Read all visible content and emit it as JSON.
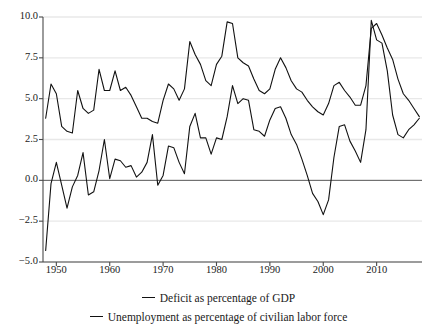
{
  "chart_data": {
    "type": "line",
    "title": "",
    "xlabel": "",
    "ylabel": "",
    "xlim": [
      1947.5,
      2018.5
    ],
    "ylim": [
      -5.0,
      10.0
    ],
    "grid": true,
    "grid_axis": "y",
    "legend_position": "bottom",
    "zero_line": 0.0,
    "yticks": [
      10.0,
      7.5,
      5.0,
      2.5,
      0.0,
      -2.5,
      -5.0
    ],
    "ytick_labels": [
      "10.0",
      "7.5",
      "5.0",
      "2.5",
      "0.0",
      "−2.5",
      "−5.0"
    ],
    "xticks": [
      1950,
      1960,
      1970,
      1980,
      1990,
      2000,
      2010
    ],
    "xtick_labels": [
      "1950",
      "1960",
      "1970",
      "1980",
      "1990",
      "2000",
      "2010"
    ],
    "x": [
      1948,
      1949,
      1950,
      1951,
      1952,
      1953,
      1954,
      1955,
      1956,
      1957,
      1958,
      1959,
      1960,
      1961,
      1962,
      1963,
      1964,
      1965,
      1966,
      1967,
      1968,
      1969,
      1970,
      1971,
      1972,
      1973,
      1974,
      1975,
      1976,
      1977,
      1978,
      1979,
      1980,
      1981,
      1982,
      1983,
      1984,
      1985,
      1986,
      1987,
      1988,
      1989,
      1990,
      1991,
      1992,
      1993,
      1994,
      1995,
      1996,
      1997,
      1998,
      1999,
      2000,
      2001,
      2002,
      2003,
      2004,
      2005,
      2006,
      2007,
      2008,
      2009,
      2010,
      2011,
      2012,
      2013,
      2014,
      2015,
      2016,
      2017,
      2018
    ],
    "series": [
      {
        "name": "Deficit as percentage of GDP",
        "color": "#111111",
        "values": [
          -4.3,
          -0.2,
          1.1,
          -0.3,
          -1.7,
          -0.4,
          0.3,
          1.7,
          -0.9,
          -0.7,
          0.6,
          2.5,
          0.1,
          1.3,
          1.2,
          0.8,
          0.9,
          0.2,
          0.5,
          1.1,
          2.8,
          -0.3,
          0.3,
          2.1,
          2.0,
          1.1,
          0.4,
          3.3,
          4.1,
          2.6,
          2.6,
          1.6,
          2.6,
          2.5,
          3.9,
          5.8,
          4.7,
          5.0,
          4.9,
          3.1,
          3.0,
          2.7,
          3.7,
          4.4,
          4.5,
          3.8,
          2.8,
          2.2,
          1.3,
          0.3,
          -0.8,
          -1.3,
          -2.1,
          -1.2,
          1.4,
          3.3,
          3.4,
          2.4,
          1.8,
          1.1,
          3.1,
          9.8,
          8.6,
          8.4,
          6.7,
          4.0,
          2.8,
          2.6,
          3.1,
          3.4,
          3.8
        ]
      },
      {
        "name": "Unemployment as percentage of civilian labor force",
        "color": "#111111",
        "values": [
          3.8,
          5.9,
          5.3,
          3.3,
          3.0,
          2.9,
          5.5,
          4.4,
          4.1,
          4.3,
          6.8,
          5.5,
          5.5,
          6.7,
          5.5,
          5.7,
          5.2,
          4.5,
          3.8,
          3.8,
          3.6,
          3.5,
          4.9,
          5.9,
          5.6,
          4.9,
          5.6,
          8.5,
          7.7,
          7.1,
          6.1,
          5.8,
          7.1,
          7.6,
          9.7,
          9.6,
          7.5,
          7.2,
          7.0,
          6.2,
          5.5,
          5.3,
          5.6,
          6.8,
          7.5,
          6.9,
          6.1,
          5.6,
          5.4,
          4.9,
          4.5,
          4.2,
          4.0,
          4.7,
          5.8,
          6.0,
          5.5,
          5.1,
          4.6,
          4.6,
          5.8,
          9.3,
          9.6,
          8.9,
          8.1,
          7.4,
          6.2,
          5.3,
          4.9,
          4.4,
          3.9
        ]
      }
    ],
    "legend": [
      {
        "label": "Deficit as percentage of GDP",
        "marker": "line",
        "color": "#111111"
      },
      {
        "label": "Unemployment as percentage of civilian labor force",
        "marker": "line",
        "color": "#111111"
      }
    ]
  },
  "axes": {
    "grid_color": "#e8e8e8",
    "axis_color": "#4a4a4a",
    "zero_line_color": "#555555"
  }
}
